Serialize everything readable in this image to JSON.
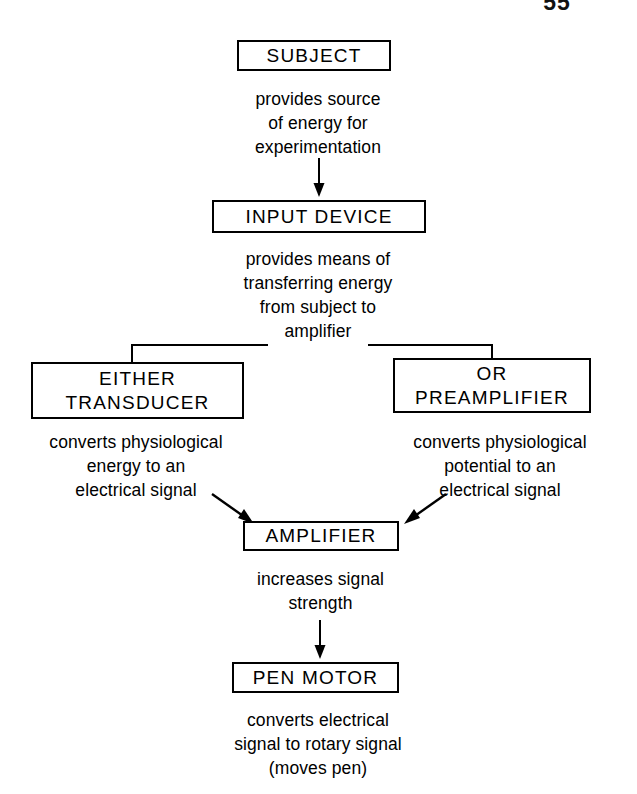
{
  "page": {
    "number": "55"
  },
  "diagram": {
    "type": "flowchart",
    "orientation": "top-to-bottom",
    "nodes": [
      {
        "id": "subject",
        "label": "SUBJECT",
        "label_line2": ""
      },
      {
        "id": "input",
        "label": "INPUT DEVICE",
        "label_line2": ""
      },
      {
        "id": "transducer",
        "label": "EITHER",
        "label_line2": "TRANSDUCER"
      },
      {
        "id": "preamp",
        "label": "OR",
        "label_line2": "PREAMPLIFIER"
      },
      {
        "id": "amplifier",
        "label": "AMPLIFIER",
        "label_line2": ""
      },
      {
        "id": "penmotor",
        "label": "PEN MOTOR",
        "label_line2": ""
      }
    ],
    "captions": {
      "subject_to_input": "provides source\nof energy for\nexperimentation",
      "input_to_branch": "provides means of\ntransferring energy\nfrom subject to\namplifier",
      "transducer_to_amp": "converts physiological\nenergy to an\nelectrical signal",
      "preamp_to_amp": "converts physiological\npotential to an\nelectrical signal",
      "amp_to_pen": "increases signal\nstrength",
      "pen_output": "converts electrical\nsignal to rotary signal\n(moves pen)"
    },
    "edges": [
      {
        "from": "subject",
        "to": "input",
        "style": "straight-arrow-down"
      },
      {
        "from": "input",
        "to": "transducer",
        "style": "elbow-split-left"
      },
      {
        "from": "input",
        "to": "preamp",
        "style": "elbow-split-right"
      },
      {
        "from": "transducer",
        "to": "amplifier",
        "style": "diagonal-arrow-down-right"
      },
      {
        "from": "preamp",
        "to": "amplifier",
        "style": "diagonal-arrow-down-left"
      },
      {
        "from": "amplifier",
        "to": "penmotor",
        "style": "straight-arrow-down"
      }
    ],
    "colors": {
      "stroke": "#000000",
      "background": "#ffffff",
      "text": "#000000"
    }
  }
}
